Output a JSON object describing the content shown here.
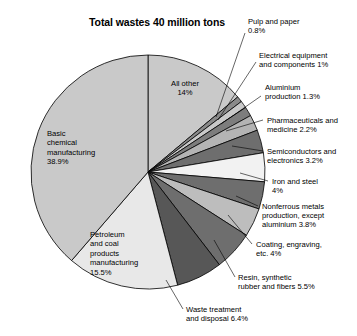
{
  "chart_data": {
    "type": "pie",
    "title": "Total wastes 40 million tons",
    "xlabel": "",
    "ylabel": "",
    "total_label": "40 million tons",
    "units": "percent",
    "legend": "none",
    "grid": false,
    "start_angle_deg": 0,
    "direction": "clockwise",
    "categories": [
      "All other",
      "Pulp and paper",
      "Electrical equipment and components",
      "Aluminium production",
      "Pharmaceuticals and medicine",
      "Semiconductors and electronics",
      "Iron and steel",
      "Nonferrous metals production, except aluminium",
      "Coating, engraving, etc.",
      "Resin, synthetic rubber and fibers",
      "Waste treatment and disposal",
      "Petroleum and coal products manufacturing",
      "Basic chemical manufacturing"
    ],
    "values": [
      14,
      0.8,
      1,
      1.3,
      2.2,
      3.2,
      4,
      3.8,
      4,
      5.5,
      6.4,
      15.5,
      38.9
    ],
    "slices": [
      {
        "name": "All other",
        "value": 14,
        "value_label": "14%",
        "label_lines": "All other\n14%",
        "color": "#c9c9c9",
        "label_placement": "inside"
      },
      {
        "name": "Pulp and paper",
        "value": 0.8,
        "value_label": "0.8%",
        "label_lines": "Pulp and paper\n0.8%",
        "color": "#8a8a8a",
        "label_placement": "outside"
      },
      {
        "name": "Electrical equipment and components",
        "value": 1,
        "value_label": "1%",
        "label_lines": "Electrical equipment\nand components 1%",
        "color": "#c9c9c9",
        "label_placement": "outside"
      },
      {
        "name": "Aluminium production",
        "value": 1.3,
        "value_label": "1.3%",
        "label_lines": "Aluminium\nproduction 1.3%",
        "color": "#7d7d7d",
        "label_placement": "outside"
      },
      {
        "name": "Pharmaceuticals and medicine",
        "value": 2.2,
        "value_label": "2.2%",
        "label_lines": "Pharmaceuticals and\nmedicine 2.2%",
        "color": "#b4b4b4",
        "label_placement": "outside"
      },
      {
        "name": "Semiconductors and electronics",
        "value": 3.2,
        "value_label": "3.2%",
        "label_lines": "Semiconductors and\nelectronics 3.2%",
        "color": "#6e6e6e",
        "label_placement": "outside"
      },
      {
        "name": "Iron and steel",
        "value": 4,
        "value_label": "4%",
        "label_lines": "Iron and steel\n4%",
        "color": "#f2f2f2",
        "label_placement": "outside"
      },
      {
        "name": "Nonferrous metals production, except aluminium",
        "value": 3.8,
        "value_label": "3.8%",
        "label_lines": "Nonferrous metals\nproduction, except\naluminium 3.8%",
        "color": "#6e6e6e",
        "label_placement": "outside"
      },
      {
        "name": "Coating, engraving, etc.",
        "value": 4,
        "value_label": "4%",
        "label_lines": "Coating, engraving,\netc. 4%",
        "color": "#bdbdbd",
        "label_placement": "outside"
      },
      {
        "name": "Resin, synthetic rubber and fibers",
        "value": 5.5,
        "value_label": "5.5%",
        "label_lines": "Resin, synthetic\nrubber and fibers 5.5%",
        "color": "#6e6e6e",
        "label_placement": "outside"
      },
      {
        "name": "Waste treatment and disposal",
        "value": 6.4,
        "value_label": "6.4%",
        "label_lines": "Waste treatment\nand disposal 6.4%",
        "color": "#575757",
        "label_placement": "outside"
      },
      {
        "name": "Petroleum and coal products manufacturing",
        "value": 15.5,
        "value_label": "15.5%",
        "label_lines": "Petroleum\nand coal\nproducts\nmanufacturing\n15.5%",
        "color": "#e8e8e8",
        "label_placement": "inside"
      },
      {
        "name": "Basic chemical manufacturing",
        "value": 38.9,
        "value_label": "38.9%",
        "label_lines": "Basic\nchemical\nmanufacturing\n38.9%",
        "color": "#c9c9c9",
        "label_placement": "inside"
      }
    ]
  },
  "geometry": {
    "cx": 148,
    "cy": 172,
    "r": 117,
    "stroke": "#000000"
  },
  "inside_labels": [
    {
      "key": "all-other",
      "text": "All other\n14%",
      "x": 155,
      "y": 79,
      "w": 60,
      "align": "center"
    },
    {
      "key": "basic-chemical",
      "text": "Basic\nchemical\nmanufacturing\n38.9%",
      "x": 47,
      "y": 129,
      "w": 78,
      "align": "left"
    },
    {
      "key": "petroleum-coal",
      "text": "Petroleum\nand coal\nproducts\nmanufacturing\n15.5%",
      "x": 90,
      "y": 230,
      "w": 80,
      "align": "left"
    }
  ],
  "outside_labels": [
    {
      "key": "pulp-and-paper",
      "text": "Pulp and paper\n0.8%",
      "x": 248,
      "y": 17,
      "w": 105,
      "align": "left",
      "leader": [
        [
          245,
          33
        ],
        [
          216,
          117
        ]
      ]
    },
    {
      "key": "electrical-equipment",
      "text": "Electrical equipment\nand components 1%",
      "x": 259,
      "y": 51,
      "w": 98,
      "align": "left",
      "leader": [
        [
          256,
          62
        ],
        [
          218,
          120
        ]
      ]
    },
    {
      "key": "aluminium-production",
      "text": "Aluminium\nproduction 1.3%",
      "x": 265,
      "y": 83,
      "w": 92,
      "align": "left",
      "leader": [
        [
          261,
          96
        ],
        [
          221,
          124
        ]
      ]
    },
    {
      "key": "pharmaceuticals",
      "text": "Pharmaceuticals and\nmedicine 2.2%",
      "x": 267,
      "y": 116,
      "w": 90,
      "align": "left",
      "leader": [
        [
          263,
          120
        ],
        [
          226,
          131
        ]
      ]
    },
    {
      "key": "semiconductors",
      "text": "Semiconductors and\nelectronics 3.2%",
      "x": 267,
      "y": 147,
      "w": 90,
      "align": "left",
      "leader": [
        [
          263,
          151
        ],
        [
          232,
          146
        ]
      ]
    },
    {
      "key": "iron-and-steel",
      "text": "Iron and steel\n4%",
      "x": 272,
      "y": 177,
      "w": 85,
      "align": "left",
      "leader": [
        [
          268,
          181
        ],
        [
          240,
          173
        ]
      ]
    },
    {
      "key": "nonferrous-metals",
      "text": "Nonferrous metals\nproduction, except\naluminium 3.8%",
      "x": 262,
      "y": 202,
      "w": 95,
      "align": "left",
      "leader": [
        [
          258,
          206
        ],
        [
          236,
          196
        ]
      ]
    },
    {
      "key": "coating-engraving",
      "text": "Coating, engraving,\netc. 4%",
      "x": 256,
      "y": 240,
      "w": 101,
      "align": "left",
      "leader": [
        [
          252,
          244
        ],
        [
          228,
          215
        ]
      ]
    },
    {
      "key": "resin-synthetic",
      "text": "Resin, synthetic\nrubber and fibers 5.5%",
      "x": 238,
      "y": 273,
      "w": 119,
      "align": "left",
      "leader": [
        [
          235,
          277
        ],
        [
          214,
          240
        ]
      ]
    },
    {
      "key": "waste-treatment",
      "text": "Waste treatment\nand disposal 6.4%",
      "x": 186,
      "y": 305,
      "w": 110,
      "align": "left",
      "leader": [
        [
          183,
          309
        ],
        [
          166,
          280
        ]
      ]
    }
  ]
}
